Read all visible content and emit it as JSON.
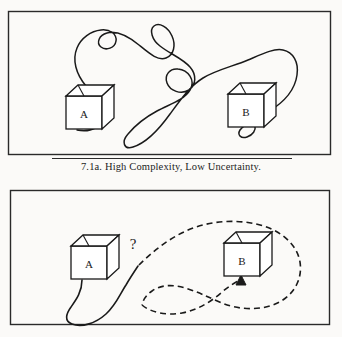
{
  "figure": {
    "id": "7.1a",
    "caption": "7.1a.  High Complexity, Low Uncertainty.",
    "caption_number": "7.1a.",
    "caption_label": "High Complexity, Low Uncertainty.",
    "background_color": "#fbfaf8",
    "ink_color": "#1a1a1a"
  },
  "panel_top": {
    "name": "high-complexity-low-uncertainty-panel",
    "frame": {
      "x": 8,
      "y": 11,
      "width": 323,
      "height": 144
    },
    "box_a": {
      "label": "A",
      "x": 55,
      "y": 86,
      "width": 46,
      "height": 44
    },
    "box_b": {
      "label": "B",
      "x": 220,
      "y": 84,
      "width": 46,
      "height": 44
    },
    "connector": {
      "style": "solid",
      "description": "convoluted looping squiggle from A to B",
      "loops": 4
    }
  },
  "panel_bottom": {
    "name": "low-complexity-high-uncertainty-panel",
    "frame": {
      "x": 10,
      "y": 190,
      "width": 320,
      "height": 135
    },
    "box_a": {
      "label": "A",
      "x": 60,
      "y": 236,
      "width": 46,
      "height": 44
    },
    "box_b": {
      "label": "B",
      "x": 218,
      "y": 232,
      "width": 46,
      "height": 44
    },
    "uncertainty_marker": {
      "symbol": "?",
      "x": 131,
      "y": 235
    },
    "connector_solid": {
      "style": "solid",
      "description": "curve from bottom of A dipping down and rising to the question mark junction"
    },
    "connector_dashed": {
      "style": "dashed",
      "description": "dashed curve from the question mark junction looping around B, arrow into bottom of B",
      "arrowhead": true,
      "dash_pattern": "6 4"
    }
  }
}
